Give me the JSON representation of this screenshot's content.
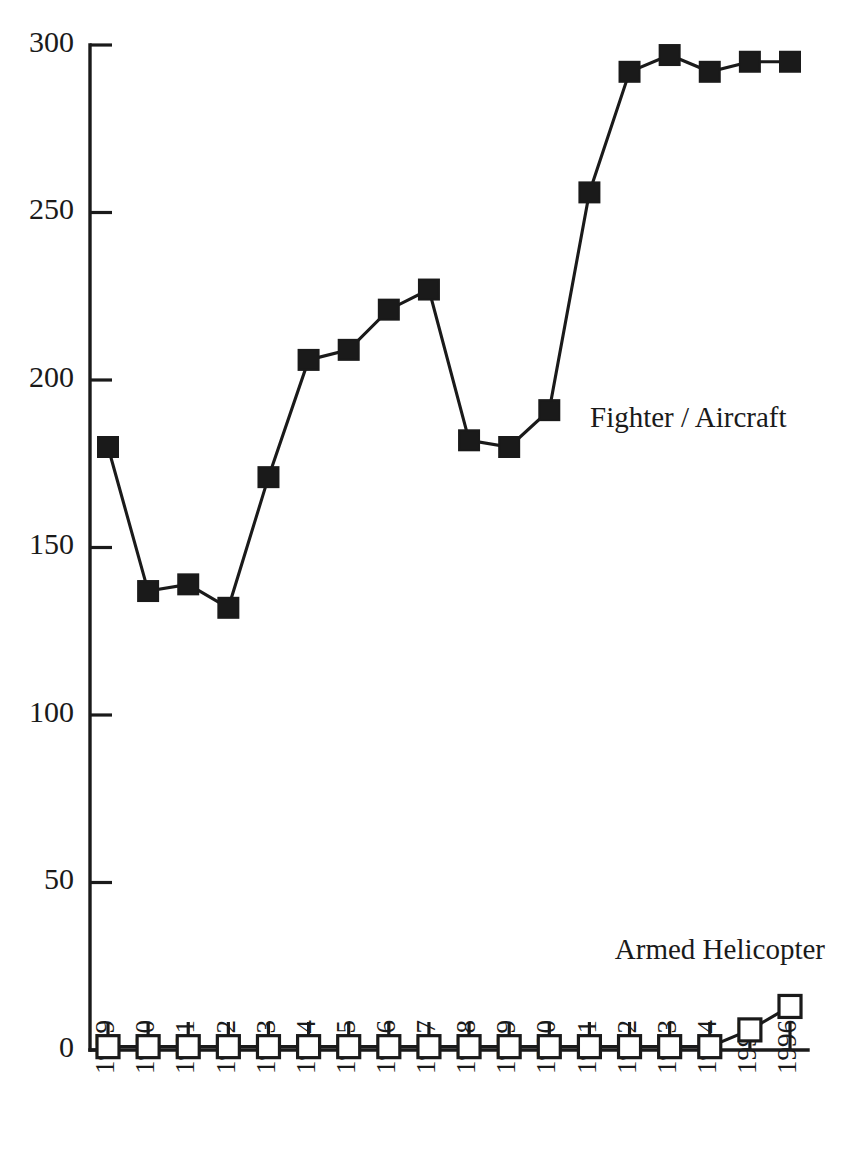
{
  "chart_data": {
    "type": "line",
    "title": "",
    "subtitle": "",
    "xlabel": "",
    "ylabel": "",
    "categories": [
      "1979",
      "1980",
      "1981",
      "1982",
      "1983",
      "1984",
      "1985",
      "1986",
      "1987",
      "1988",
      "1989",
      "1990",
      "1991",
      "1992",
      "1993",
      "1994",
      "1995",
      "1996"
    ],
    "x": [
      1979,
      1980,
      1981,
      1982,
      1983,
      1984,
      1985,
      1986,
      1987,
      1988,
      1989,
      1990,
      1991,
      1992,
      1993,
      1994,
      1995,
      1996
    ],
    "series": [
      {
        "name": "Fighter / Aircraft",
        "marker": "filled-square",
        "color": "#1a1a1a",
        "values": [
          180,
          137,
          139,
          132,
          171,
          206,
          209,
          221,
          227,
          182,
          180,
          191,
          256,
          292,
          297,
          292,
          295,
          295
        ]
      },
      {
        "name": "Armed Helicopter",
        "marker": "open-square",
        "color": "#1a1a1a",
        "values": [
          1,
          1,
          1,
          1,
          1,
          1,
          1,
          1,
          1,
          1,
          1,
          1,
          1,
          1,
          1,
          1,
          6,
          13
        ]
      }
    ],
    "ylim": [
      0,
      300
    ],
    "yticks": [
      0,
      50,
      100,
      150,
      200,
      250,
      300
    ],
    "ytick_labels": [
      "0",
      "50",
      "100",
      "150",
      "200",
      "250",
      "300"
    ],
    "grid": false,
    "legend_position": "inline-annotations",
    "annotations": [
      {
        "text": "Fighter / Aircraft",
        "series": "Fighter / Aircraft",
        "x": 590,
        "y": 420,
        "align": "start"
      },
      {
        "text": "Armed Helicopter",
        "series": "Armed Helicopter",
        "x": 825,
        "y": 952,
        "align": "end"
      }
    ]
  },
  "axes": {
    "y_axis_label_color": "#1a1a1a",
    "axis_color": "#1a1a1a",
    "background": "#ffffff"
  }
}
